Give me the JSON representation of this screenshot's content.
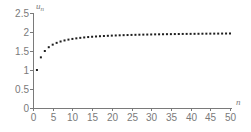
{
  "chart_data": {
    "type": "scatter",
    "title": "",
    "xlabel": "n",
    "ylabel": "u_n",
    "ylabel_base": "u",
    "ylabel_sub": "n",
    "xlim": [
      0,
      50
    ],
    "ylim": [
      0,
      2.5
    ],
    "grid": false,
    "legend": null,
    "x_ticks": [
      0,
      5,
      10,
      15,
      20,
      25,
      30,
      35,
      40,
      45,
      50
    ],
    "x_tick_labels": [
      "0",
      "5",
      "10",
      "15",
      "20",
      "25",
      "30",
      "35",
      "40",
      "45",
      "50"
    ],
    "y_ticks": [
      0,
      0.5,
      1,
      1.5,
      2,
      2.5
    ],
    "y_tick_labels": [
      "0",
      "0.5",
      "1",
      "1.5",
      "2",
      "2.5"
    ],
    "series": [
      {
        "name": "u_n",
        "x": [
          1,
          2,
          3,
          4,
          5,
          6,
          7,
          8,
          9,
          10,
          11,
          12,
          13,
          14,
          15,
          16,
          17,
          18,
          19,
          20,
          21,
          22,
          23,
          24,
          25,
          26,
          27,
          28,
          29,
          30,
          31,
          32,
          33,
          34,
          35,
          36,
          37,
          38,
          39,
          40,
          41,
          42,
          43,
          44,
          45,
          46,
          47,
          48,
          49,
          50
        ],
        "values": [
          1.0,
          1.333,
          1.5,
          1.6,
          1.667,
          1.714,
          1.75,
          1.778,
          1.8,
          1.818,
          1.833,
          1.846,
          1.857,
          1.867,
          1.875,
          1.882,
          1.889,
          1.895,
          1.9,
          1.905,
          1.909,
          1.913,
          1.917,
          1.92,
          1.923,
          1.926,
          1.929,
          1.931,
          1.933,
          1.935,
          1.938,
          1.939,
          1.941,
          1.943,
          1.944,
          1.946,
          1.947,
          1.949,
          1.95,
          1.951,
          1.952,
          1.953,
          1.955,
          1.956,
          1.957,
          1.957,
          1.958,
          1.959,
          1.96,
          1.961
        ]
      }
    ],
    "colors": {
      "axis": "#7a7a7a",
      "points": "#1e1e1e",
      "background": "#ffffff"
    }
  }
}
